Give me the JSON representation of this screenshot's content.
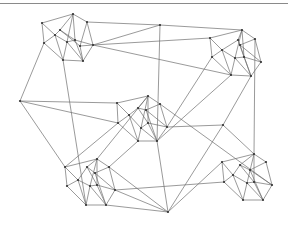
{
  "diagram": {
    "type": "network-graph",
    "colors": {
      "edge": "#6e6e6e",
      "node": "#333333",
      "rule": "#8a8a8a",
      "background": "#ffffff"
    },
    "clusters": [
      {
        "name": "top-left",
        "nodes": [
          [
            42,
            23
          ],
          [
            73,
            14
          ],
          [
            87,
            22
          ],
          [
            93,
            45
          ],
          [
            83,
            61
          ],
          [
            63,
            60
          ],
          [
            44,
            43
          ],
          [
            55,
            35
          ],
          [
            60,
            30
          ],
          [
            67,
            42
          ],
          [
            75,
            40
          ],
          [
            80,
            46
          ]
        ]
      },
      {
        "name": "top-right",
        "nodes": [
          [
            210,
            38
          ],
          [
            242,
            30
          ],
          [
            255,
            39
          ],
          [
            261,
            62
          ],
          [
            251,
            76
          ],
          [
            231,
            75
          ],
          [
            212,
            57
          ],
          [
            222,
            50
          ],
          [
            238,
            40
          ],
          [
            235,
            58
          ],
          [
            244,
            57
          ],
          [
            240,
            45
          ]
        ]
      },
      {
        "name": "center",
        "nodes": [
          [
            117,
            103
          ],
          [
            148,
            96
          ],
          [
            160,
            104
          ],
          [
            167,
            127
          ],
          [
            157,
            141
          ],
          [
            138,
            141
          ],
          [
            118,
            123
          ],
          [
            129,
            115
          ],
          [
            138,
            108
          ],
          [
            141,
            128
          ],
          [
            148,
            123
          ],
          [
            146,
            110
          ]
        ]
      },
      {
        "name": "bottom-left",
        "nodes": [
          [
            65,
            167
          ],
          [
            97,
            159
          ],
          [
            109,
            167
          ],
          [
            115,
            190
          ],
          [
            106,
            205
          ],
          [
            86,
            205
          ],
          [
            67,
            186
          ],
          [
            78,
            180
          ],
          [
            87,
            167
          ],
          [
            90,
            186
          ],
          [
            97,
            185
          ],
          [
            95,
            173
          ]
        ]
      },
      {
        "name": "bottom-right",
        "nodes": [
          [
            222,
            162
          ],
          [
            254,
            154
          ],
          [
            266,
            162
          ],
          [
            272,
            185
          ],
          [
            263,
            200
          ],
          [
            243,
            200
          ],
          [
            224,
            182
          ],
          [
            233,
            175
          ],
          [
            240,
            165
          ],
          [
            247,
            183
          ],
          [
            254,
            182
          ],
          [
            250,
            170
          ]
        ]
      }
    ],
    "cluster_edges": [
      [
        0,
        1
      ],
      [
        1,
        2
      ],
      [
        2,
        3
      ],
      [
        3,
        4
      ],
      [
        4,
        5
      ],
      [
        5,
        6
      ],
      [
        6,
        0
      ],
      [
        0,
        7
      ],
      [
        1,
        8
      ],
      [
        1,
        9
      ],
      [
        8,
        7
      ],
      [
        7,
        9
      ],
      [
        8,
        10
      ],
      [
        9,
        10
      ],
      [
        9,
        5
      ],
      [
        10,
        4
      ],
      [
        10,
        3
      ],
      [
        1,
        10
      ],
      [
        7,
        5
      ],
      [
        8,
        11
      ],
      [
        11,
        4
      ],
      [
        2,
        11
      ],
      [
        11,
        3
      ],
      [
        6,
        7
      ],
      [
        9,
        4
      ]
    ],
    "hubs": [
      [
        20,
        101
      ],
      [
        160,
        25
      ],
      [
        168,
        212
      ],
      [
        223,
        125
      ]
    ],
    "long_edges": [
      [
        [
          87,
          22
        ],
        [
          160,
          25
        ]
      ],
      [
        [
          93,
          45
        ],
        [
          160,
          25
        ]
      ],
      [
        [
          93,
          45
        ],
        [
          210,
          38
        ]
      ],
      [
        [
          93,
          45
        ],
        [
          231,
          75
        ]
      ],
      [
        [
          44,
          43
        ],
        [
          20,
          101
        ]
      ],
      [
        [
          63,
          60
        ],
        [
          86,
          205
        ]
      ],
      [
        [
          20,
          101
        ],
        [
          117,
          103
        ]
      ],
      [
        [
          20,
          101
        ],
        [
          65,
          167
        ]
      ],
      [
        [
          20,
          101
        ],
        [
          118,
          123
        ]
      ],
      [
        [
          160,
          25
        ],
        [
          242,
          30
        ]
      ],
      [
        [
          160,
          25
        ],
        [
          157,
          141
        ]
      ],
      [
        [
          231,
          75
        ],
        [
          157,
          141
        ]
      ],
      [
        [
          251,
          76
        ],
        [
          223,
          125
        ]
      ],
      [
        [
          255,
          39
        ],
        [
          254,
          154
        ]
      ],
      [
        [
          212,
          57
        ],
        [
          167,
          127
        ]
      ],
      [
        [
          223,
          125
        ],
        [
          167,
          127
        ]
      ],
      [
        [
          223,
          125
        ],
        [
          168,
          212
        ]
      ],
      [
        [
          223,
          125
        ],
        [
          254,
          154
        ]
      ],
      [
        [
          148,
          96
        ],
        [
          97,
          159
        ]
      ],
      [
        [
          138,
          141
        ],
        [
          109,
          167
        ]
      ],
      [
        [
          157,
          141
        ],
        [
          168,
          212
        ]
      ],
      [
        [
          109,
          167
        ],
        [
          168,
          212
        ]
      ],
      [
        [
          115,
          190
        ],
        [
          168,
          212
        ]
      ],
      [
        [
          106,
          205
        ],
        [
          168,
          212
        ]
      ],
      [
        [
          222,
          162
        ],
        [
          168,
          212
        ]
      ],
      [
        [
          224,
          182
        ],
        [
          115,
          190
        ]
      ],
      [
        [
          160,
          104
        ],
        [
          272,
          185
        ]
      ],
      [
        [
          118,
          123
        ],
        [
          65,
          167
        ]
      ]
    ]
  }
}
